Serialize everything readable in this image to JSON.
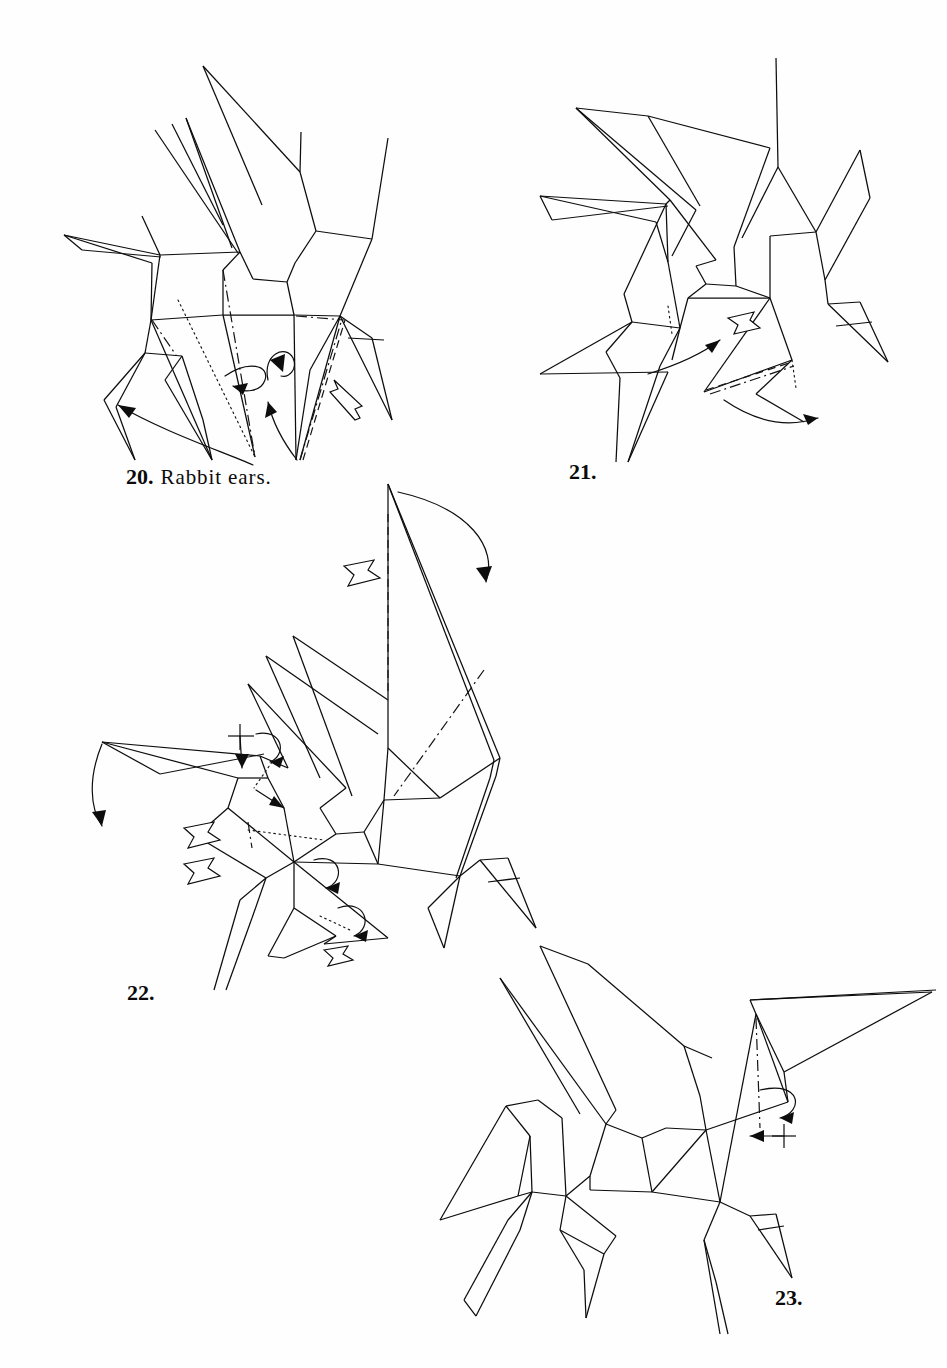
{
  "page": {
    "kind": "origami-instruction-page",
    "background_color": "#ffffff",
    "ink_color": "#0d0d0d",
    "folio": ""
  },
  "captions": [
    {
      "id": "fig20",
      "number": "20.",
      "text": "Rabbit ears."
    },
    {
      "id": "fig21",
      "number": "21.",
      "text": ""
    },
    {
      "id": "fig22",
      "number": "22.",
      "text": ""
    },
    {
      "id": "fig23",
      "number": "23.",
      "text": ""
    }
  ],
  "figures": [
    {
      "id": "fig20",
      "label": "20.",
      "caption": "Rabbit ears.",
      "subject": "origami pegasus in progress, front and rear legs splayed",
      "annotations": [
        "mountain-fold line on rear leg",
        "hidden dotted line through body",
        "rabbit-ear rotation loop arrow left",
        "rabbit-ear rotation loop arrow right",
        "large curved swing arrow to lower-left",
        "curved arrow up into body",
        "hollow push arrow at rear leg"
      ]
    },
    {
      "id": "fig21",
      "label": "21.",
      "caption": "",
      "subject": "result of step 20, legs narrowed",
      "annotations": [
        "hidden dotted line on front leg",
        "hidden dotted line on rear leg",
        "valley fold dashed line along rear leg",
        "hollow push arrow at rear leg",
        "curved arrow pointing right under body",
        "curved arrow sweeping right at rear hoof"
      ]
    },
    {
      "id": "fig22",
      "label": "22.",
      "caption": "",
      "subject": "pegasus with large tail flap raised, head being crimped",
      "annotations": [
        "valley fold dashed line on tail flap",
        "mountain fold dash-dot line on wing",
        "hollow push arrow at tail flap",
        "large curved arrow folding tail down to the right",
        "curved arrow swinging ear down-left",
        "crimp cross mark with down arrow at head",
        "two hollow push arrows at chest",
        "hidden dotted line across chest",
        "loop arrow at belly",
        "loop arrow at rear leg",
        "hollow push arrow at rear hoof"
      ]
    },
    {
      "id": "fig23",
      "label": "23.",
      "caption": "",
      "subject": "completed pegasus form with wings and tail",
      "annotations": [
        "mountain fold dash-dot line at head",
        "loop arrow at head",
        "crimp cross mark with left arrow at muzzle"
      ]
    }
  ]
}
